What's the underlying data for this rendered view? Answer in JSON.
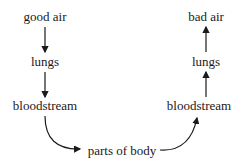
{
  "diagram": {
    "type": "flow",
    "nodes": {
      "good_air": "good air",
      "lungs_left": "lungs",
      "bloodstream_left": "bloodstream",
      "parts_of_body": "parts of body",
      "bloodstream_right": "bloodstream",
      "lungs_right": "lungs",
      "bad_air": "bad air"
    },
    "edges": [
      {
        "from": "good air",
        "to": "lungs"
      },
      {
        "from": "lungs",
        "to": "bloodstream"
      },
      {
        "from": "bloodstream",
        "to": "parts of body"
      },
      {
        "from": "parts of body",
        "to": "bloodstream"
      },
      {
        "from": "bloodstream",
        "to": "lungs"
      },
      {
        "from": "lungs",
        "to": "bad air"
      }
    ]
  }
}
